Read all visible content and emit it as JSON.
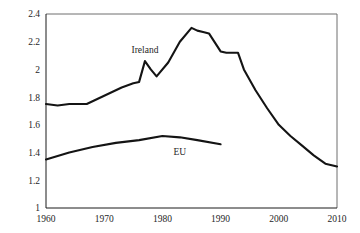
{
  "chart_data": {
    "type": "line",
    "title": "",
    "subtitle": "",
    "xlabel": "",
    "ylabel": "",
    "xlim": [
      1960,
      2010
    ],
    "ylim": [
      1,
      2.4
    ],
    "grid": false,
    "legend_position": "inline-annotation",
    "x_ticks": [
      1960,
      1970,
      1980,
      1990,
      2000,
      2010
    ],
    "x_tick_labels": [
      "1960",
      "1970",
      "1980",
      "1990",
      "2000",
      "2010"
    ],
    "y_ticks": [
      1,
      1.2,
      1.4,
      1.6,
      1.8,
      2,
      2.2,
      2.4
    ],
    "y_tick_labels": [
      "1",
      "1.2",
      "1.4",
      "1.6",
      "1.8",
      "2",
      "2.2",
      "2.4"
    ],
    "annotations": [
      {
        "text": "Ireland",
        "x": 1977,
        "y": 2.12
      },
      {
        "text": "EU",
        "x": 1983,
        "y": 1.38
      }
    ],
    "series": [
      {
        "name": "Ireland",
        "label": "Ireland",
        "color": "#141414",
        "x": [
          1960,
          1962,
          1964,
          1967,
          1969,
          1971,
          1973,
          1975,
          1976,
          1977,
          1978,
          1979,
          1981,
          1983,
          1985,
          1986,
          1987,
          1988,
          1990,
          1991,
          1993,
          1994,
          1996,
          1998,
          2000,
          2002,
          2004,
          2006,
          2008,
          2010
        ],
        "values": [
          1.75,
          1.74,
          1.75,
          1.75,
          1.79,
          1.83,
          1.87,
          1.9,
          1.91,
          2.06,
          2.0,
          1.95,
          2.05,
          2.2,
          2.3,
          2.28,
          2.27,
          2.26,
          2.13,
          2.12,
          2.12,
          2.0,
          1.85,
          1.72,
          1.6,
          1.52,
          1.45,
          1.38,
          1.32,
          1.3
        ]
      },
      {
        "name": "EU",
        "label": "EU",
        "color": "#141414",
        "x": [
          1960,
          1964,
          1968,
          1972,
          1976,
          1980,
          1983,
          1986,
          1990
        ],
        "values": [
          1.35,
          1.4,
          1.44,
          1.47,
          1.49,
          1.52,
          1.51,
          1.49,
          1.46
        ]
      }
    ]
  }
}
